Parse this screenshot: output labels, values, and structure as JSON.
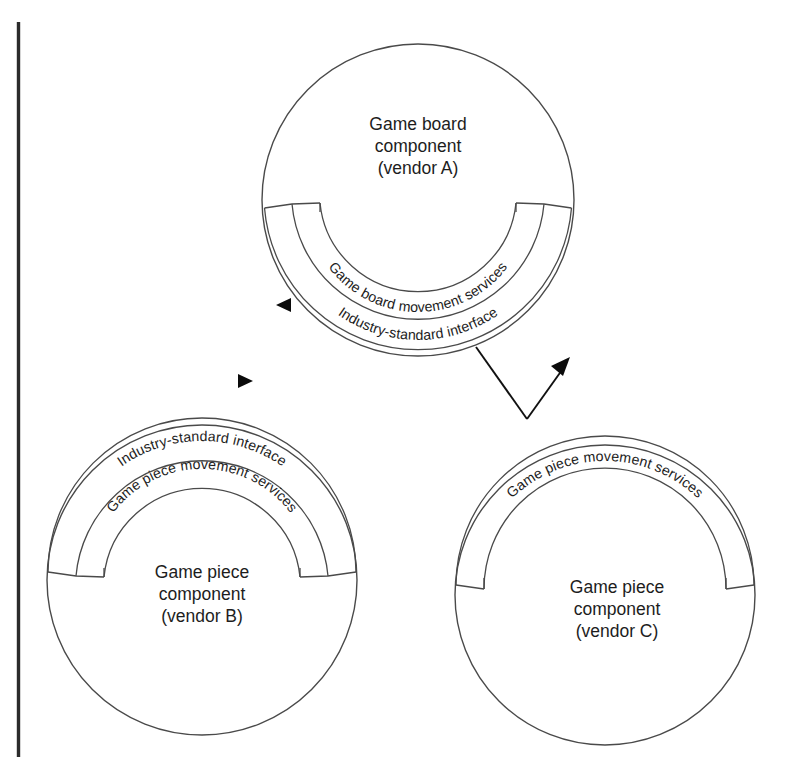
{
  "diagram": {
    "background_color": "#ffffff",
    "line_color": "#4a4a4a",
    "text_color": "#1d1d1d",
    "edge_rule_color": "#2b2b2b",
    "components": [
      {
        "id": "game-board-vendor-a",
        "center_label_line1": "Game board",
        "center_label_line2": "component",
        "center_label_line3": "(vendor A)",
        "outer_ring_label": "Industry-standard interface",
        "inner_ring_label": "Game board movement services",
        "socket_side": "bottom",
        "arrow_marker": "left-triangle"
      },
      {
        "id": "game-piece-vendor-b",
        "center_label_line1": "Game piece",
        "center_label_line2": "component",
        "center_label_line3": "(vendor B)",
        "outer_ring_label": "Industry-standard interface",
        "inner_ring_label": "Game piece movement services",
        "socket_side": "top",
        "arrow_marker": "right-triangle"
      },
      {
        "id": "game-piece-vendor-c",
        "center_label_line1": "Game piece",
        "center_label_line2": "component",
        "center_label_line3": "(vendor C)",
        "outer_ring_label": "",
        "inner_ring_label": "Game piece movement services",
        "socket_side": "top",
        "arrow_marker": "none"
      }
    ],
    "connector": {
      "id": "vendor-c-to-vendor-a",
      "label": "",
      "arrow_head": "up-right-triangle"
    }
  }
}
